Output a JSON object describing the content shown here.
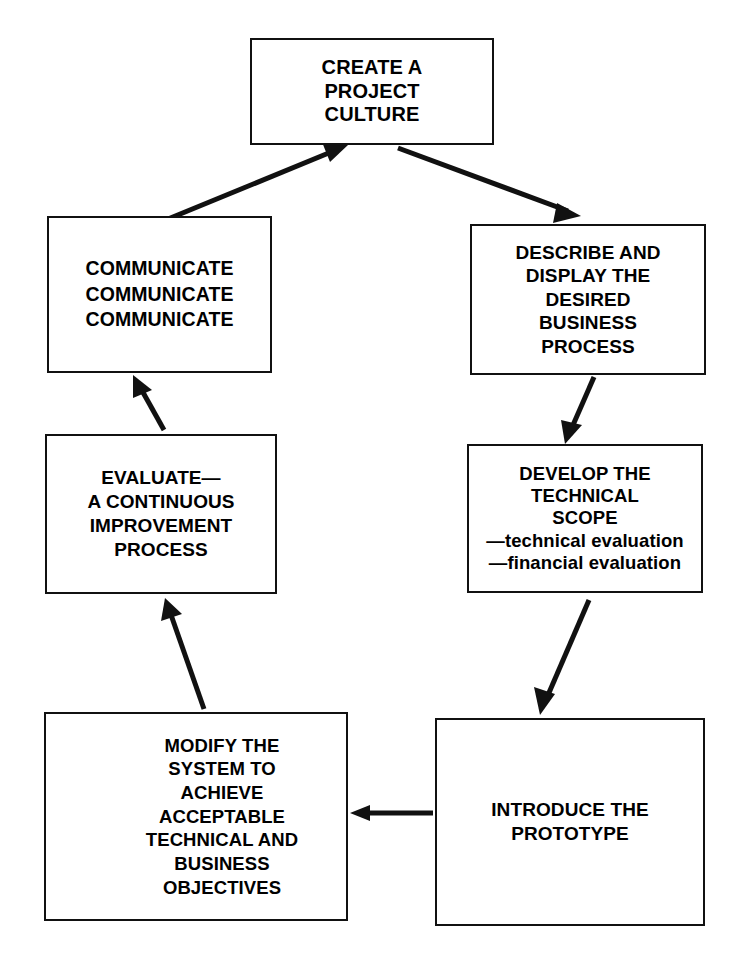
{
  "diagram": {
    "caption": "",
    "stroke_color": "#111111",
    "background_color": "#ffffff",
    "nodes": [
      {
        "id": "create",
        "label": "CREATE A\nPROJECT\nCULTURE",
        "name": "node-create-a-project-culture"
      },
      {
        "id": "communicate",
        "label": "COMMUNICATE\nCOMMUNICATE\nCOMMUNICATE",
        "name": "node-communicate"
      },
      {
        "id": "describe",
        "label": "DESCRIBE AND\nDISPLAY THE\nDESIRED\nBUSINESS\nPROCESS",
        "name": "node-describe-and-display-the-desired-business-process"
      },
      {
        "id": "evaluate",
        "label": "EVALUATE—\nA CONTINUOUS\nIMPROVEMENT\nPROCESS",
        "name": "node-evaluate-a-continuous-improvement-process"
      },
      {
        "id": "develop",
        "label": "DEVELOP THE\nTECHNICAL\nSCOPE\n—technical evaluation\n—financial evaluation",
        "name": "node-develop-the-technical-scope"
      },
      {
        "id": "modify",
        "label": "MODIFY THE\nSYSTEM TO\nACHIEVE\nACCEPTABLE\nTECHNICAL AND\nBUSINESS\nOBJECTIVES",
        "name": "node-modify-the-system"
      },
      {
        "id": "introduce",
        "label": "INTRODUCE THE\nPROTOTYPE",
        "name": "node-introduce-the-prototype"
      }
    ],
    "edges": [
      {
        "id": "e1",
        "from": "communicate",
        "to": "create",
        "direction": "up-right",
        "style": "diagonal"
      },
      {
        "id": "e2",
        "from": "create",
        "to": "describe",
        "direction": "down-right",
        "style": "diagonal"
      },
      {
        "id": "e3",
        "from": "describe",
        "to": "develop",
        "direction": "down",
        "style": "diagonal"
      },
      {
        "id": "e4",
        "from": "develop",
        "to": "introduce",
        "direction": "down-left",
        "style": "diagonal"
      },
      {
        "id": "e5",
        "from": "introduce",
        "to": "modify",
        "direction": "left",
        "style": "horizontal"
      },
      {
        "id": "e6",
        "from": "modify",
        "to": "evaluate",
        "direction": "up-left",
        "style": "diagonal"
      },
      {
        "id": "e7",
        "from": "evaluate",
        "to": "communicate",
        "direction": "up-left",
        "style": "diagonal"
      }
    ]
  }
}
